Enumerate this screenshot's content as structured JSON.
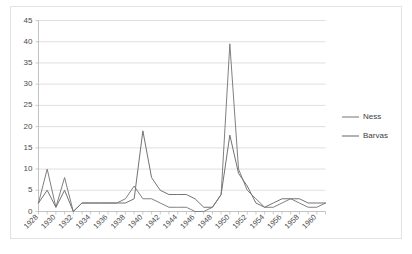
{
  "chart_data": {
    "type": "line",
    "title": "",
    "subtitle": "",
    "xlabel": "",
    "ylabel": "",
    "xlim": [
      1928,
      1961
    ],
    "ylim": [
      0,
      45
    ],
    "y_ticks": [
      0,
      5,
      10,
      15,
      20,
      25,
      30,
      35,
      40,
      45
    ],
    "x_ticks": [
      1928,
      1930,
      1932,
      1934,
      1936,
      1938,
      1940,
      1942,
      1944,
      1946,
      1948,
      1950,
      1952,
      1954,
      1956,
      1958,
      1960
    ],
    "x_tick_labels": [
      "1928",
      "1930",
      "1932",
      "1934",
      "1936",
      "1938",
      "1940",
      "1942",
      "1944",
      "1946",
      "1948",
      "1950",
      "1952",
      "1954",
      "1956",
      "1958",
      "1960"
    ],
    "x_tick_rotation": -45,
    "grid": "horizontal",
    "legend_position": "right",
    "x": [
      1928,
      1929,
      1930,
      1931,
      1932,
      1933,
      1934,
      1935,
      1936,
      1937,
      1938,
      1939,
      1940,
      1941,
      1942,
      1943,
      1944,
      1945,
      1946,
      1947,
      1948,
      1949,
      1950,
      1951,
      1952,
      1953,
      1954,
      1955,
      1956,
      1957,
      1958,
      1959,
      1960,
      1961
    ],
    "series": [
      {
        "name": "Ness",
        "color": "#808080",
        "values": [
          2,
          10,
          1,
          8,
          0,
          2,
          2,
          2,
          2,
          2,
          3,
          6,
          3,
          3,
          2,
          1,
          1,
          1,
          0,
          0,
          1,
          4,
          39.5,
          10,
          5,
          3,
          1,
          1,
          2,
          3,
          2,
          1,
          1,
          2
        ]
      },
      {
        "name": "Barvas",
        "color": "#737373",
        "values": [
          2,
          5,
          1,
          5,
          0,
          2,
          2,
          2,
          2,
          2,
          2,
          3,
          19,
          8,
          5,
          4,
          4,
          4,
          3,
          1,
          1,
          4,
          18,
          9,
          6,
          2,
          1,
          2,
          3,
          3,
          3,
          2,
          2,
          2
        ]
      }
    ],
    "legend": [
      {
        "label": "Ness",
        "color": "#808080"
      },
      {
        "label": "Barvas",
        "color": "#737373"
      }
    ]
  }
}
